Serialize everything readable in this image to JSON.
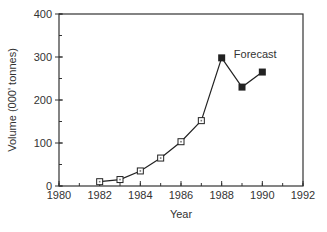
{
  "chart_data": {
    "type": "line",
    "title": "",
    "xlabel": "Year",
    "ylabel": "Volume (000' tonnes)",
    "xlim": [
      1980,
      1992
    ],
    "ylim": [
      0,
      400
    ],
    "x_ticks": [
      1980,
      1982,
      1984,
      1986,
      1988,
      1990,
      1992
    ],
    "x_tick_labels": [
      "1980",
      "1982",
      "1984",
      "1986",
      "1988",
      "1990",
      "1992"
    ],
    "x_minor_step": 1,
    "y_ticks": [
      0,
      100,
      200,
      300,
      400
    ],
    "y_tick_labels": [
      "0",
      "100",
      "200",
      "300",
      "400"
    ],
    "y_minor_step": 50,
    "grid": false,
    "legend": null,
    "series": [
      {
        "name": "Actual",
        "marker": "open-square",
        "x": [
          1982,
          1983,
          1984,
          1985,
          1986,
          1987
        ],
        "values": [
          10,
          15,
          35,
          65,
          103,
          152
        ]
      },
      {
        "name": "Forecast",
        "marker": "filled-square",
        "x": [
          1987,
          1988,
          1989,
          1990
        ],
        "values": [
          152,
          298,
          230,
          265
        ]
      }
    ],
    "annotations": [
      {
        "text": "Forecast",
        "x": 1988.6,
        "y": 300
      }
    ]
  },
  "colors": {
    "line": "#222222",
    "axis": "#333333",
    "text": "#333333",
    "background": "#ffffff"
  }
}
